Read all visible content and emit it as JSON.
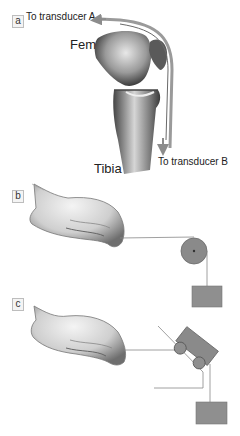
{
  "figure": {
    "panels": [
      {
        "id": "a",
        "label": "a",
        "labels": {
          "transducer_a": "To transducer A",
          "femur": "Femur",
          "tibia": "Tibia",
          "transducer_b": "To transducer B"
        }
      },
      {
        "id": "b",
        "label": "b"
      },
      {
        "id": "c",
        "label": "c"
      }
    ],
    "colors": {
      "bone_dark": "#555555",
      "bone_light": "#d8d8d8",
      "tendon_arrow": "#8c8c8c",
      "pulley": "#8a8a8a",
      "weight": "#8f8f8f",
      "string": "#888888",
      "skin": "#e6e6e6",
      "skin_shade": "#9a9a9a"
    }
  }
}
